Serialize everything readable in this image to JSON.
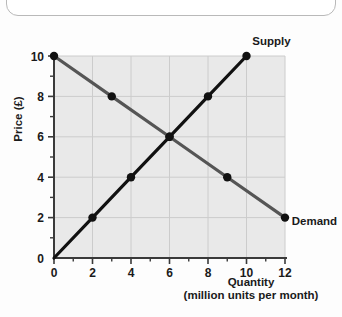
{
  "figure": {
    "background_color": "#e9e9e9",
    "grid_color": "#cccccc",
    "axis_color": "#3a3a3a",
    "supply_color": "#111111",
    "demand_color": "#555555"
  },
  "chart_data": {
    "type": "line",
    "title": "",
    "xlabel": "Quantity",
    "xlabel_sub": "(million units per month)",
    "ylabel": "Price (£)",
    "xlim": [
      0,
      12
    ],
    "ylim": [
      0,
      10
    ],
    "xticks": [
      0,
      2,
      4,
      6,
      8,
      10,
      12
    ],
    "xtick_labels": [
      "0",
      "2",
      "4",
      "6",
      "8",
      "10",
      "12"
    ],
    "xminorticks": [
      1,
      3,
      5,
      7,
      9,
      11
    ],
    "yticks": [
      0,
      2,
      4,
      6,
      8,
      10
    ],
    "ytick_labels": [
      "0",
      "2",
      "4",
      "6",
      "8",
      "10"
    ],
    "yminorticks": [
      1,
      3,
      5,
      7,
      9
    ],
    "grid": true,
    "legend_position": "inline-right",
    "series": [
      {
        "name": "Supply",
        "label": "Supply",
        "color": "#111111",
        "x": [
          0,
          2,
          4,
          6,
          8,
          10
        ],
        "y": [
          0,
          2,
          4,
          6,
          8,
          10
        ],
        "markers": [
          {
            "x": 2,
            "y": 2
          },
          {
            "x": 4,
            "y": 4
          },
          {
            "x": 6,
            "y": 6
          },
          {
            "x": 8,
            "y": 8
          },
          {
            "x": 10,
            "y": 10
          }
        ],
        "label_at": {
          "x": 10.3,
          "y": 10.75
        }
      },
      {
        "name": "Demand",
        "label": "Demand",
        "color": "#555555",
        "x": [
          0,
          3,
          6,
          9,
          12
        ],
        "y": [
          10,
          8,
          6,
          4,
          2
        ],
        "markers": [
          {
            "x": 0,
            "y": 10
          },
          {
            "x": 3,
            "y": 8
          },
          {
            "x": 6,
            "y": 6
          },
          {
            "x": 9,
            "y": 4
          },
          {
            "x": 12,
            "y": 2
          }
        ],
        "label_at": {
          "x": 12.35,
          "y": 1.85
        }
      }
    ],
    "equilibrium": {
      "x": 6,
      "y": 6
    }
  }
}
